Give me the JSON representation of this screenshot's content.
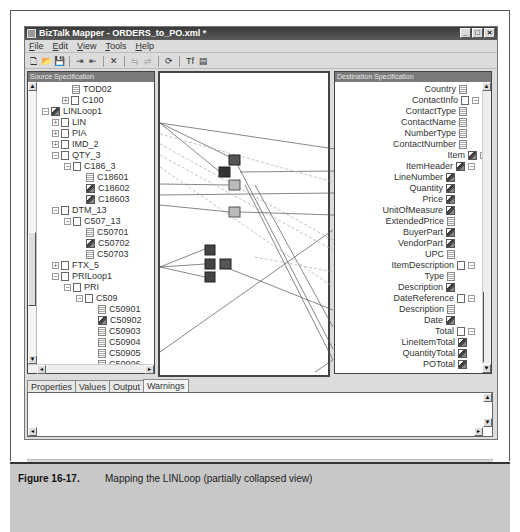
{
  "window": {
    "title": "BizTalk Mapper - ORDERS_to_PO.xml *",
    "controls": {
      "minimize": "_",
      "maximize": "□",
      "close": "×"
    }
  },
  "menu": [
    "File",
    "Edit",
    "View",
    "Tools",
    "Help"
  ],
  "toolbar": [
    {
      "icon": "new-document-icon",
      "glyph": "🗋"
    },
    {
      "icon": "open-folder-icon",
      "glyph": "📂"
    },
    {
      "icon": "save-icon",
      "glyph": "💾"
    },
    {
      "icon": "indent-icon",
      "glyph": "⇥"
    },
    {
      "icon": "outdent-icon",
      "glyph": "⇤"
    },
    {
      "icon": "delete-icon",
      "glyph": "✕"
    },
    {
      "icon": "link-icon",
      "glyph": "⇋",
      "disabled": true
    },
    {
      "icon": "unlink-icon",
      "glyph": "⇌",
      "disabled": true
    },
    {
      "icon": "test-map-icon",
      "glyph": "⟳"
    },
    {
      "icon": "functoid-palette-icon",
      "glyph": "Tf"
    },
    {
      "icon": "compile-icon",
      "glyph": "▤"
    }
  ],
  "source": {
    "header": "Source Specification",
    "rows": [
      {
        "label": "TOD02",
        "indent": 58,
        "type": "leaf",
        "expander": ""
      },
      {
        "label": "C100",
        "indent": 48,
        "type": "node",
        "expander": "+"
      },
      {
        "label": "LINLoop1",
        "indent": 28,
        "type": "linked",
        "expander": "−"
      },
      {
        "label": "LIN",
        "indent": 38,
        "type": "node",
        "expander": "+"
      },
      {
        "label": "PIA",
        "indent": 38,
        "type": "node",
        "expander": "+"
      },
      {
        "label": "IMD_2",
        "indent": 38,
        "type": "node",
        "expander": "+"
      },
      {
        "label": "QTY_3",
        "indent": 38,
        "type": "node",
        "expander": "−"
      },
      {
        "label": "C186_3",
        "indent": 50,
        "type": "node",
        "expander": "−"
      },
      {
        "label": "C18601",
        "indent": 72,
        "type": "leaf",
        "expander": ""
      },
      {
        "label": "C18602",
        "indent": 72,
        "type": "linked",
        "expander": ""
      },
      {
        "label": "C18603",
        "indent": 72,
        "type": "linked",
        "expander": ""
      },
      {
        "label": "DTM_13",
        "indent": 38,
        "type": "node",
        "expander": "−"
      },
      {
        "label": "C507_13",
        "indent": 50,
        "type": "node",
        "expander": "−"
      },
      {
        "label": "C50701",
        "indent": 72,
        "type": "leaf",
        "expander": ""
      },
      {
        "label": "C50702",
        "indent": 72,
        "type": "linked",
        "expander": ""
      },
      {
        "label": "C50703",
        "indent": 72,
        "type": "leaf",
        "expander": ""
      },
      {
        "label": "FTX_5",
        "indent": 38,
        "type": "node",
        "expander": "+"
      },
      {
        "label": "PRILoop1",
        "indent": 38,
        "type": "node",
        "expander": "−"
      },
      {
        "label": "PRI",
        "indent": 50,
        "type": "node",
        "expander": "−"
      },
      {
        "label": "C509",
        "indent": 62,
        "type": "node",
        "expander": "−"
      },
      {
        "label": "C50901",
        "indent": 84,
        "type": "leaf",
        "expander": ""
      },
      {
        "label": "C50902",
        "indent": 84,
        "type": "linked",
        "expander": ""
      },
      {
        "label": "C50903",
        "indent": 84,
        "type": "leaf",
        "expander": ""
      },
      {
        "label": "C50904",
        "indent": 84,
        "type": "leaf",
        "expander": ""
      },
      {
        "label": "C50905",
        "indent": 84,
        "type": "leaf",
        "expander": ""
      },
      {
        "label": "C50906",
        "indent": 84,
        "type": "leaf",
        "expander": ""
      }
    ]
  },
  "destination": {
    "header": "Destination Specification",
    "rows": [
      {
        "label": "Country",
        "right": 30,
        "type": "leaf",
        "expander": ""
      },
      {
        "label": "ContactInfo",
        "right": 18,
        "type": "node",
        "expander": "−"
      },
      {
        "label": "ContactType",
        "right": 30,
        "type": "leaf",
        "expander": ""
      },
      {
        "label": "ContactName",
        "right": 30,
        "type": "leaf",
        "expander": ""
      },
      {
        "label": "NumberType",
        "right": 30,
        "type": "leaf",
        "expander": ""
      },
      {
        "label": "ContactNumber",
        "right": 30,
        "type": "leaf",
        "expander": ""
      },
      {
        "label": "Item",
        "right": 10,
        "type": "linked",
        "expander": "−"
      },
      {
        "label": "ItemHeader",
        "right": 22,
        "type": "linked",
        "expander": "−"
      },
      {
        "label": "LineNumber",
        "right": 42,
        "type": "linked",
        "expander": ""
      },
      {
        "label": "Quantity",
        "right": 42,
        "type": "linked",
        "expander": ""
      },
      {
        "label": "Price",
        "right": 42,
        "type": "linked",
        "expander": ""
      },
      {
        "label": "UnitOfMeasure",
        "right": 42,
        "type": "linked",
        "expander": ""
      },
      {
        "label": "ExtendedPrice",
        "right": 42,
        "type": "leaf",
        "expander": ""
      },
      {
        "label": "BuyerPart",
        "right": 42,
        "type": "linked",
        "expander": ""
      },
      {
        "label": "VendorPart",
        "right": 42,
        "type": "linked",
        "expander": ""
      },
      {
        "label": "UPC",
        "right": 42,
        "type": "leaf",
        "expander": ""
      },
      {
        "label": "ItemDescription",
        "right": 22,
        "type": "node",
        "expander": "−"
      },
      {
        "label": "Type",
        "right": 42,
        "type": "leaf",
        "expander": ""
      },
      {
        "label": "Description",
        "right": 42,
        "type": "linked",
        "expander": ""
      },
      {
        "label": "DateReference",
        "right": 22,
        "type": "node",
        "expander": "−"
      },
      {
        "label": "Description",
        "right": 42,
        "type": "leaf",
        "expander": ""
      },
      {
        "label": "Date",
        "right": 42,
        "type": "linked",
        "expander": ""
      },
      {
        "label": "Total",
        "right": 22,
        "type": "node",
        "expander": "−"
      },
      {
        "label": "LineItemTotal",
        "right": 30,
        "type": "linked",
        "expander": ""
      },
      {
        "label": "QuantityTotal",
        "right": 30,
        "type": "linked",
        "expander": ""
      },
      {
        "label": "POTotal",
        "right": 30,
        "type": "linked",
        "expander": ""
      }
    ]
  },
  "bottom_tabs": [
    "Properties",
    "Values",
    "Output",
    "Warnings"
  ],
  "active_tab": "Warnings",
  "caption": {
    "number": "Figure 16-17.",
    "text": "Mapping the LINLoop (partially collapsed view)"
  }
}
